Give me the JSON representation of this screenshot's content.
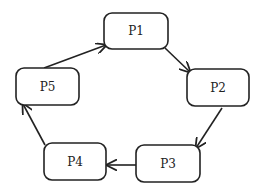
{
  "diagram": {
    "type": "cycle",
    "background": "#ffffff",
    "stroke_color": "#222222",
    "nodes": [
      {
        "id": "P1",
        "label": "P1",
        "x": 104,
        "y": 13,
        "w": 64,
        "h": 36
      },
      {
        "id": "P2",
        "label": "P2",
        "x": 187,
        "y": 69,
        "w": 62,
        "h": 37
      },
      {
        "id": "P3",
        "label": "P3",
        "x": 136,
        "y": 145,
        "w": 64,
        "h": 37
      },
      {
        "id": "P4",
        "label": "P4",
        "x": 44,
        "y": 143,
        "w": 62,
        "h": 37
      },
      {
        "id": "P5",
        "label": "P5",
        "x": 16,
        "y": 68,
        "w": 63,
        "h": 37
      }
    ],
    "edges": [
      {
        "from": "P1",
        "to": "P2",
        "x1": 165,
        "y1": 48,
        "x2": 190,
        "y2": 72
      },
      {
        "from": "P2",
        "to": "P3",
        "x1": 222,
        "y1": 108,
        "x2": 196,
        "y2": 148
      },
      {
        "from": "P3",
        "to": "P4",
        "x1": 136,
        "y1": 165,
        "x2": 107,
        "y2": 165
      },
      {
        "from": "P4",
        "to": "P5",
        "x1": 45,
        "y1": 145,
        "x2": 23,
        "y2": 104
      },
      {
        "from": "P5",
        "to": "P1",
        "x1": 44,
        "y1": 68,
        "x2": 106,
        "y2": 45
      }
    ]
  }
}
